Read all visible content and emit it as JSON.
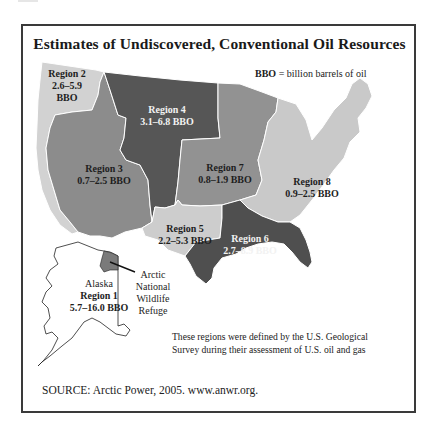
{
  "figure": {
    "title": "Estimates of Undiscovered, Conventional Oil Resources",
    "legend": {
      "abbr": "BBO",
      "definition": " = billion barrels of oil"
    },
    "regions": [
      {
        "id": "region-1",
        "prefix": "Alaska",
        "name": "Region 1",
        "estimate": "5.7–16.0 BBO",
        "color": "#ffffff"
      },
      {
        "id": "region-2",
        "name": "Region 2",
        "estimate_line1": "2.6–5.9",
        "estimate_line2": "BBO",
        "color": "#d2d2d2"
      },
      {
        "id": "region-3",
        "name": "Region 3",
        "estimate": "0.7–2.5 BBO",
        "color": "#8c8c8c"
      },
      {
        "id": "region-4",
        "name": "Region 4",
        "estimate": "3.1–6.8 BBO",
        "color": "#565656"
      },
      {
        "id": "region-5",
        "name": "Region 5",
        "estimate": "2.2–5.3 BBO",
        "color": "#cdcdcd"
      },
      {
        "id": "region-6",
        "name": "Region 6",
        "estimate": "2.7–8.9 BBO",
        "color": "#4f4f4f"
      },
      {
        "id": "region-7",
        "name": "Region 7",
        "estimate": "0.8–1.9 BBO",
        "color": "#929292"
      },
      {
        "id": "region-8",
        "name": "Region 8",
        "estimate": "0.9–2.5 BBO",
        "color": "#c9c9c9"
      }
    ],
    "anwr_label": {
      "line1": "Arctic",
      "line2": "National",
      "line3": "Wildlife",
      "line4": "Refuge",
      "color": "#7a7a7a"
    },
    "note": "These regions were defined by the U.S. Geological Survey during their assessment of U.S. oil and gas",
    "source": "SOURCE: Arctic Power, 2005. www.anwr.org."
  }
}
